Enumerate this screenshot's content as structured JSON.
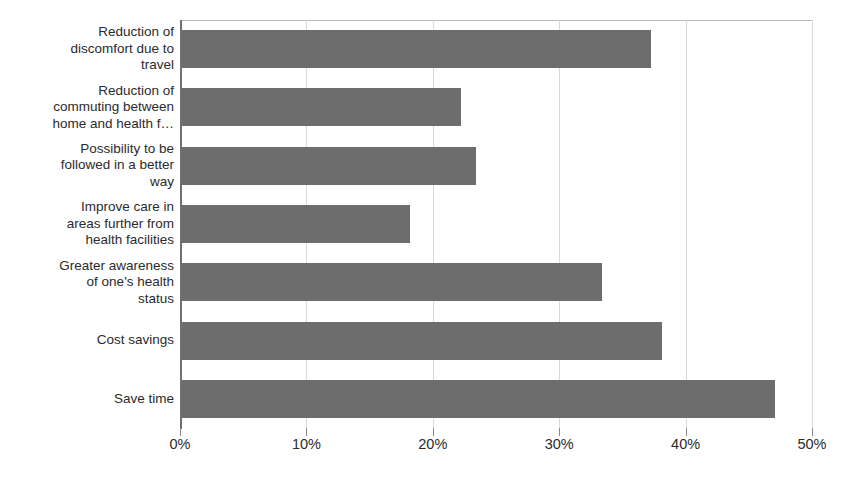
{
  "chart_data": {
    "type": "bar",
    "orientation": "horizontal",
    "title": "",
    "subtitle": "",
    "xlabel": "",
    "ylabel": "",
    "xlim": [
      0,
      50
    ],
    "grid": true,
    "legend": false,
    "legend_position": "none",
    "value_suffix": "%",
    "bar_color": "#6d6d6d",
    "gridline_color": "#d9d9d9",
    "axis_color": "#707070",
    "categories": [
      "Reduction of discomfort due to travel",
      "Reduction of commuting between home and health f…",
      "Possibility to be followed in a better way",
      "Improve care in areas further from health facilities",
      "Greater awareness of one's health status",
      "Cost savings",
      "Save time"
    ],
    "category_lines": [
      [
        "Reduction of",
        "discomfort due to",
        "travel"
      ],
      [
        "Reduction of",
        "commuting between",
        "home and health f…"
      ],
      [
        "Possibility to be",
        "followed in a better",
        "way"
      ],
      [
        "Improve care in",
        "areas further from",
        "health facilities"
      ],
      [
        "Greater awareness",
        "of one's health",
        "status"
      ],
      [
        "Cost savings"
      ],
      [
        "Save time"
      ]
    ],
    "values": [
      37.3,
      22.2,
      23.4,
      18.2,
      33.4,
      38.1,
      47.1
    ],
    "xticks": [
      0,
      10,
      20,
      30,
      40,
      50
    ],
    "xticklabels": [
      "0%",
      "10%",
      "20%",
      "30%",
      "40%",
      "50%"
    ]
  }
}
